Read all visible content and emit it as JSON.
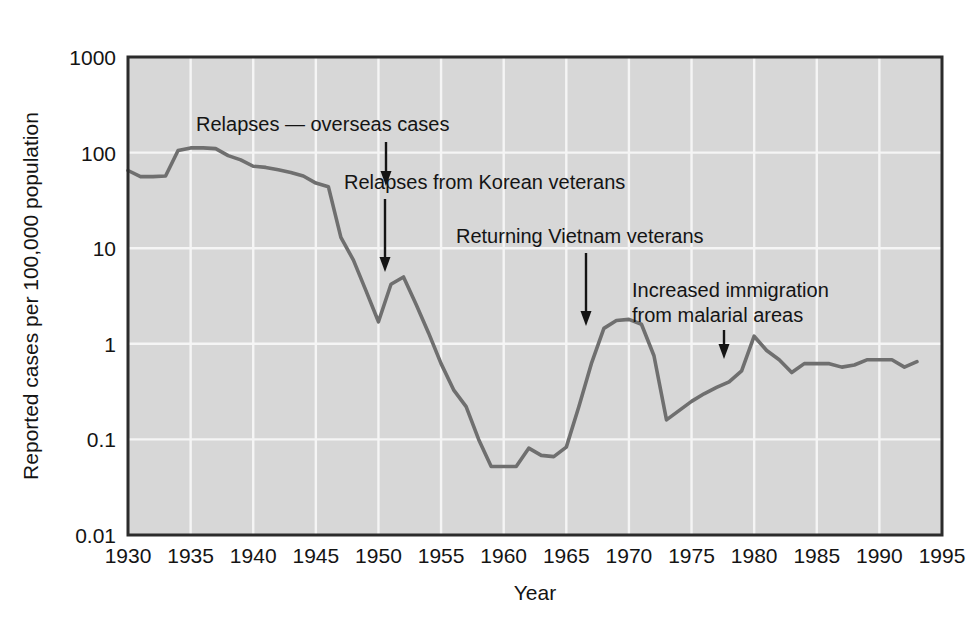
{
  "chart_data": {
    "type": "line",
    "title": "",
    "subtitle": "",
    "xlabel": "Year",
    "ylabel": "Reported cases per 100,000 population",
    "yscale": "log",
    "xlim": [
      1930,
      1995
    ],
    "ylim": [
      0.01,
      1000
    ],
    "grid": true,
    "legend_position": "none",
    "xticks": [
      "1930",
      "1935",
      "1940",
      "1945",
      "1950",
      "1955",
      "1960",
      "1965",
      "1970",
      "1975",
      "1980",
      "1985",
      "1990",
      "1995"
    ],
    "yticks": [
      "1000",
      "100",
      "10",
      "1",
      "0.1",
      "0.01"
    ],
    "series": [
      {
        "name": "Reported malaria cases",
        "color": "#6f6f6f",
        "x": [
          1930,
          1931,
          1932,
          1933,
          1934,
          1935,
          1936,
          1937,
          1938,
          1939,
          1940,
          1941,
          1942,
          1943,
          1944,
          1945,
          1946,
          1947,
          1948,
          1949,
          1950,
          1951,
          1952,
          1953,
          1954,
          1955,
          1956,
          1957,
          1958,
          1959,
          1960,
          1961,
          1962,
          1963,
          1964,
          1965,
          1966,
          1967,
          1968,
          1969,
          1970,
          1971,
          1972,
          1973,
          1974,
          1975,
          1976,
          1977,
          1978,
          1979,
          1980,
          1981,
          1982,
          1983,
          1984,
          1985,
          1986,
          1987,
          1988,
          1989,
          1990,
          1991,
          1992,
          1993
        ],
        "y": [
          65,
          56,
          56,
          57,
          105,
          112,
          112,
          110,
          93,
          84,
          72,
          70,
          66,
          62,
          57,
          48,
          44,
          13,
          7.5,
          3.6,
          1.7,
          4.2,
          5.0,
          2.6,
          1.3,
          0.62,
          0.33,
          0.22,
          0.1,
          0.052,
          0.052,
          0.052,
          0.081,
          0.068,
          0.066,
          0.083,
          0.22,
          0.62,
          1.45,
          1.75,
          1.8,
          1.6,
          0.75,
          0.16,
          0.2,
          0.25,
          0.3,
          0.35,
          0.4,
          0.52,
          1.2,
          0.85,
          0.68,
          0.5,
          0.62,
          0.62,
          0.62,
          0.57,
          0.6,
          0.68,
          0.68,
          0.68,
          0.57,
          0.65
        ]
      }
    ],
    "annotations": [
      {
        "id": "relapses-overseas",
        "text": "Relapses — overseas cases",
        "arrow_x": 1944,
        "arrow_y_value": 57
      },
      {
        "id": "relapses-korean",
        "text": "Relapses from Korean veterans",
        "arrow_x": 1951,
        "arrow_y_value": 4.2
      },
      {
        "id": "returning-vietnam",
        "text": "Returning Vietnam veterans",
        "arrow_x": 1967,
        "arrow_y_value": 1.5
      },
      {
        "id": "increased-immigration",
        "text_line1": "Increased immigration",
        "text_line2": "from malarial areas",
        "arrow_x": 1979,
        "arrow_y_value": 0.52
      }
    ],
    "colors": {
      "plot_background": "#d7d7d7",
      "gridline": "#f5f5f5",
      "axis_frame": "#2b2b2b",
      "line": "#6f6f6f",
      "text": "#141414",
      "page_background": "#ffffff"
    }
  }
}
